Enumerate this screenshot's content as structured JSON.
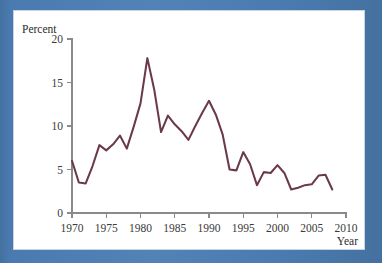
{
  "figure": {
    "frame_color": "#4a7ab0",
    "card_background": "#ffffff"
  },
  "chart_data": {
    "type": "line",
    "title": "",
    "subtitle": "",
    "xlabel": "Year",
    "ylabel": "Percent",
    "series_color": "#6b3a4a",
    "grid": false,
    "legend": false,
    "legend_position": "none",
    "xlim": [
      1970,
      2010
    ],
    "ylim": [
      0,
      20
    ],
    "xticks": [
      1970,
      1975,
      1980,
      1985,
      1990,
      1995,
      2000,
      2005,
      2010
    ],
    "xtick_labels": [
      "1970",
      "1975",
      "1980",
      "1985",
      "1990",
      "1995",
      "2000",
      "2005",
      "2010"
    ],
    "yticks": [
      0,
      5,
      10,
      15,
      20
    ],
    "ytick_labels": [
      "0",
      "5",
      "10",
      "15",
      "20"
    ],
    "x": [
      1970,
      1971,
      1972,
      1973,
      1974,
      1975,
      1976,
      1977,
      1978,
      1979,
      1980,
      1981,
      1982,
      1983,
      1984,
      1985,
      1986,
      1987,
      1988,
      1989,
      1990,
      1991,
      1992,
      1993,
      1994,
      1995,
      1996,
      1997,
      1998,
      1999,
      2000,
      2001,
      2002,
      2003,
      2004,
      2005,
      2006,
      2007,
      2008
    ],
    "values": [
      6.0,
      3.5,
      3.4,
      5.4,
      7.8,
      7.2,
      7.9,
      8.9,
      7.4,
      9.9,
      12.6,
      17.8,
      14.2,
      9.3,
      11.2,
      10.2,
      9.4,
      8.4,
      10.0,
      11.5,
      12.9,
      11.3,
      9.0,
      5.0,
      4.9,
      7.0,
      5.6,
      3.2,
      4.7,
      4.6,
      5.5,
      4.6,
      2.7,
      2.9,
      3.2,
      3.3,
      4.3,
      4.4,
      2.7
    ]
  }
}
